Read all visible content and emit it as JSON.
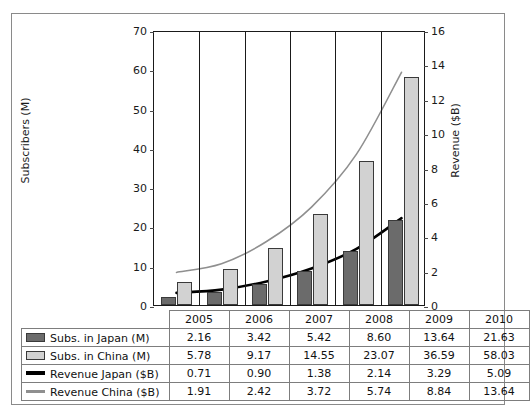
{
  "page_header": {
    "text": "",
    "page_number": ""
  },
  "chart_data": {
    "type": "bar",
    "title": "",
    "categories": [
      "2005",
      "2006",
      "2007",
      "2008",
      "2009",
      "2010"
    ],
    "xlabel": "",
    "axes": {
      "left": {
        "label": "Subscribers (M)",
        "ylim": [
          0,
          70
        ],
        "ticks": [
          0,
          10,
          20,
          30,
          40,
          50,
          60,
          70
        ],
        "ticklabels": [
          "0",
          "10",
          "20",
          "30",
          "40",
          "50",
          "60",
          "70"
        ]
      },
      "right": {
        "label": "Revenue ($B)",
        "ylim": [
          0,
          16
        ],
        "ticks": [
          0,
          2,
          4,
          6,
          8,
          10,
          12,
          14,
          16
        ],
        "ticklabels": [
          "0",
          "2",
          "4",
          "6",
          "8",
          "10",
          "12",
          "14",
          "16"
        ]
      }
    },
    "grid": false,
    "legend_position": "table-below",
    "series": [
      {
        "name": "Subs. in Japan (M)",
        "kind": "bar",
        "axis": "left",
        "color": "#6b6b6b",
        "values": [
          2.16,
          3.42,
          5.42,
          8.6,
          13.64,
          21.63
        ]
      },
      {
        "name": "Subs. in China (M)",
        "kind": "bar",
        "axis": "left",
        "color": "#d2d2d2",
        "values": [
          5.78,
          9.17,
          14.55,
          23.07,
          36.59,
          58.03
        ]
      },
      {
        "name": "Revenue Japan ($B)",
        "kind": "line",
        "axis": "right",
        "color": "#000000",
        "values": [
          0.71,
          0.9,
          1.38,
          2.14,
          3.29,
          5.09
        ]
      },
      {
        "name": "Revenue China ($B)",
        "kind": "line",
        "axis": "right",
        "color": "#8f8f8f",
        "values": [
          1.91,
          2.42,
          3.72,
          5.74,
          8.84,
          13.64
        ]
      }
    ]
  },
  "table": {
    "corner": "",
    "column_headers": [
      "2005",
      "2006",
      "2007",
      "2008",
      "2009",
      "2010"
    ],
    "rows": [
      {
        "label": "Subs. in Japan (M)",
        "swatch": "dark-bar-swatch",
        "values": [
          "2.16",
          "3.42",
          "5.42",
          "8.60",
          "13.64",
          "21.63"
        ]
      },
      {
        "label": "Subs. in China (M)",
        "swatch": "light-bar-swatch",
        "values": [
          "5.78",
          "9.17",
          "14.55",
          "23.07",
          "36.59",
          "58.03"
        ]
      },
      {
        "label": "Revenue Japan ($B)",
        "swatch": "black-line-swatch",
        "values": [
          "0.71",
          "0.90",
          "1.38",
          "2.14",
          "3.29",
          "5.09"
        ]
      },
      {
        "label": "Revenue China ($B)",
        "swatch": "gray-line-swatch",
        "values": [
          "1.91",
          "2.42",
          "3.72",
          "5.74",
          "8.84",
          "13.64"
        ]
      }
    ]
  }
}
